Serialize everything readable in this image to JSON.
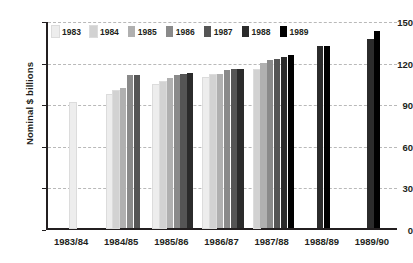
{
  "chart_data": {
    "type": "bar",
    "title": "",
    "subtitle": "",
    "xlabel": "",
    "ylabel": "Nominal $ billions",
    "ylim": [
      0,
      150
    ],
    "yticks": [
      0,
      30,
      60,
      90,
      120,
      150
    ],
    "ytick_labels": [
      "0",
      "30",
      "60",
      "90",
      "120",
      "150"
    ],
    "grid": "horizontal-dashed",
    "legend_position": "top-left-inside",
    "categories": [
      "1983/84",
      "1984/85",
      "1985/86",
      "1986/87",
      "1987/88",
      "1988/89",
      "1989/90"
    ],
    "series": [
      {
        "name": "1983",
        "color": "#ededed",
        "values": [
          90,
          96,
          103,
          108,
          null,
          null,
          null
        ]
      },
      {
        "name": "1984",
        "color": "#d2d2d2",
        "values": [
          null,
          99,
          105,
          110,
          114,
          null,
          null
        ]
      },
      {
        "name": "1985",
        "color": "#b0b0b0",
        "values": [
          null,
          101,
          108,
          111,
          119,
          null,
          null
        ]
      },
      {
        "name": "1986",
        "color": "#8a8a8a",
        "values": [
          null,
          110,
          110,
          114,
          121,
          null,
          null
        ]
      },
      {
        "name": "1987",
        "color": "#555555",
        "values": [
          null,
          110,
          111,
          115,
          122,
          null,
          null
        ]
      },
      {
        "name": "1988",
        "color": "#2b2b2b",
        "values": [
          null,
          null,
          112,
          115,
          123,
          131,
          136
        ]
      },
      {
        "name": "1989",
        "color": "#000000",
        "values": [
          null,
          null,
          null,
          null,
          125,
          131,
          142
        ]
      }
    ]
  },
  "legend": {
    "items": [
      {
        "label": "1983",
        "color": "#ededed"
      },
      {
        "label": "1984",
        "color": "#d2d2d2"
      },
      {
        "label": "1985",
        "color": "#b0b0b0"
      },
      {
        "label": "1986",
        "color": "#8a8a8a"
      },
      {
        "label": "1987",
        "color": "#555555"
      },
      {
        "label": "1988",
        "color": "#2b2b2b"
      },
      {
        "label": "1989",
        "color": "#000000"
      }
    ]
  },
  "axes": {
    "y_title": "Nominal $ billions",
    "y_ticks": [
      "150",
      "120",
      "90",
      "60",
      "30",
      "0"
    ],
    "x_ticks": [
      "1983/84",
      "1984/85",
      "1985/86",
      "1986/87",
      "1987/88",
      "1988/89",
      "1989/90"
    ]
  }
}
